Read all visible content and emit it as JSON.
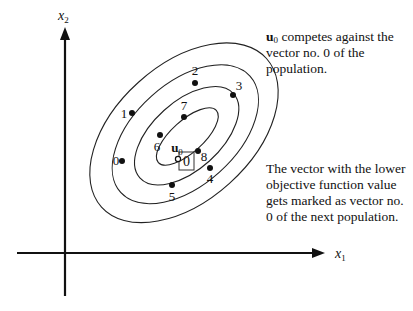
{
  "axes": {
    "x_label": "x",
    "x_subscript": "1",
    "y_label": "x",
    "y_subscript": "2"
  },
  "trial_vector": {
    "label": "u",
    "subscript": "0",
    "x": 178,
    "y": 159
  },
  "highlighted_vector": {
    "label": "0",
    "box": {
      "x": 179,
      "y": 152,
      "w": 15,
      "h": 18
    }
  },
  "population_points": [
    {
      "label": "0",
      "x": 122,
      "y": 161,
      "lx": 116,
      "ly": 165
    },
    {
      "label": "1",
      "x": 132,
      "y": 113,
      "lx": 124,
      "ly": 118
    },
    {
      "label": "2",
      "x": 195,
      "y": 83,
      "lx": 195,
      "ly": 75
    },
    {
      "label": "3",
      "x": 233,
      "y": 95,
      "lx": 239,
      "ly": 90
    },
    {
      "label": "4",
      "x": 210,
      "y": 168,
      "lx": 210,
      "ly": 183
    },
    {
      "label": "5",
      "x": 172,
      "y": 185,
      "lx": 172,
      "ly": 201
    },
    {
      "label": "6",
      "x": 160,
      "y": 135,
      "lx": 157,
      "ly": 151
    },
    {
      "label": "7",
      "x": 184,
      "y": 117,
      "lx": 184,
      "ly": 110
    },
    {
      "label": "8",
      "x": 198,
      "y": 151,
      "lx": 204,
      "ly": 161
    }
  ],
  "contours": [
    {
      "cx": 186,
      "cy": 137,
      "rx": 39,
      "ry": 16
    },
    {
      "cx": 186,
      "cy": 136,
      "rx": 63,
      "ry": 34
    },
    {
      "cx": 186,
      "cy": 134,
      "rx": 87,
      "ry": 51
    },
    {
      "cx": 186,
      "cy": 132,
      "rx": 111,
      "ry": 68
    }
  ],
  "annotations": {
    "top": {
      "bold": "u",
      "sub": "0",
      "text": " competes against the vector no. 0 of the population."
    },
    "bottom": {
      "text": "The vector with the lower objective function value gets marked as vector no. 0 of the next population."
    }
  }
}
